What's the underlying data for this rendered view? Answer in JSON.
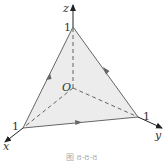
{
  "diagram": {
    "axes": {
      "x_label": "x",
      "y_label": "y",
      "z_label": "z",
      "origin_label": "O"
    },
    "intercepts": {
      "x": "1",
      "y": "1",
      "z": "1"
    },
    "caption": "图 8-8-8",
    "colors": {
      "line": "#555555",
      "fill": "#ececec",
      "axis": "#333333"
    }
  }
}
